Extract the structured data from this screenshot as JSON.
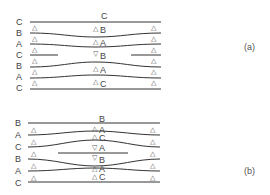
{
  "figure_a": {
    "caption": "(a)",
    "left_labels": [
      "C",
      "B",
      "A",
      "C",
      "B",
      "A",
      "C"
    ],
    "center_labels": [
      {
        "marker": "",
        "letter": "C"
      },
      {
        "marker": "△",
        "letter": "B"
      },
      {
        "marker": "△",
        "letter": "A"
      },
      {
        "marker": "▽",
        "letter": "B"
      },
      {
        "marker": "△",
        "letter": "A"
      },
      {
        "marker": "△",
        "letter": "C"
      }
    ],
    "edge_marker": "△"
  },
  "figure_b": {
    "caption": "(b)",
    "left_labels": [
      "B",
      "A",
      "C",
      "B",
      "A",
      "C"
    ],
    "center_labels": [
      {
        "marker": "",
        "letter": "B"
      },
      {
        "marker": "△",
        "letter": "A"
      },
      {
        "marker": "△",
        "letter": "C"
      },
      {
        "marker": "▽",
        "letter": "A"
      },
      {
        "marker": "▽",
        "letter": "B"
      },
      {
        "marker": "△",
        "letter": "A"
      },
      {
        "marker": "△",
        "letter": "C"
      }
    ],
    "edge_marker": "△"
  }
}
